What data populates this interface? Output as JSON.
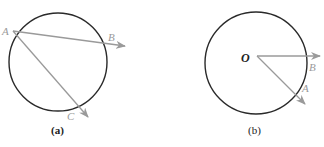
{
  "figure": {
    "panel_a": {
      "caption": "(a)",
      "circle": {
        "cx": 58,
        "cy": 62,
        "r": 49
      },
      "points": {
        "A": "A",
        "B": "B",
        "C": "C"
      },
      "description": "Two chords from point A on the circle extended as arrows through B and C"
    },
    "panel_b": {
      "caption": "(b)",
      "circle": {
        "cx": 256,
        "cy": 62,
        "r": 51
      },
      "points": {
        "O": "O",
        "A": "A",
        "B": "B"
      },
      "description": "Two radius vectors from center O extending through points A and B on the circle"
    },
    "colors": {
      "circle": "#2a2a2a",
      "arrow": "#9a9a9a",
      "label": "#9a9a9a"
    }
  }
}
